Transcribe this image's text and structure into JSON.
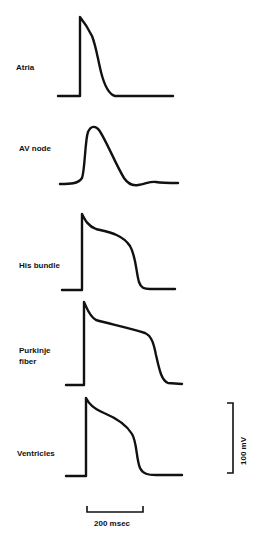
{
  "figure": {
    "traces": [
      {
        "id": "atria",
        "label": "Atria"
      },
      {
        "id": "av-node",
        "label": "AV node"
      },
      {
        "id": "his-bundle",
        "label": "His bundle"
      },
      {
        "id": "purkinje",
        "label": "Purkinje\nfiber"
      },
      {
        "id": "ventricles",
        "label": "Ventricles"
      }
    ],
    "scale_bars": {
      "voltage": {
        "label": "100 mV",
        "value": 100,
        "unit": "mV"
      },
      "time": {
        "label": "200 msec",
        "value": 200,
        "unit": "msec"
      }
    },
    "colors": {
      "ink": "#111111",
      "background": "#ffffff"
    }
  }
}
